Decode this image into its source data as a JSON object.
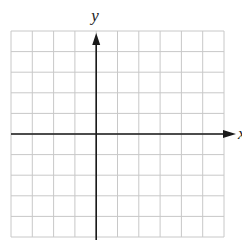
{
  "chart_data": {
    "type": "line",
    "title": "",
    "xlabel": "x",
    "ylabel": "y",
    "x_range": [
      -4,
      6
    ],
    "y_range": [
      -5,
      5
    ],
    "grid": true,
    "grid_step": 1,
    "axis_arrows": [
      "positive-x",
      "positive-y"
    ],
    "tick_labels": [],
    "series": []
  },
  "colors": {
    "grid": "#c8c8c8",
    "axis": "#1a1a1a",
    "label": "#222222"
  }
}
